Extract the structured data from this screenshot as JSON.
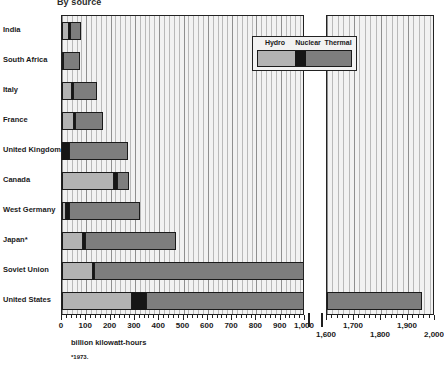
{
  "title": "By source",
  "axis_title": "billion kilowatt-hours",
  "footnote": "*1973.",
  "legend": {
    "items": [
      {
        "label": "Hydro",
        "color": "#b3b3b3"
      },
      {
        "label": "Nuclear",
        "color": "#161616"
      },
      {
        "label": "Thermal",
        "color": "#7e7e7e"
      }
    ]
  },
  "chart_data": {
    "type": "bar",
    "orientation": "horizontal",
    "stacked": true,
    "title": "By source",
    "xlabel": "billion kilowatt-hours",
    "ylabel": "",
    "grid": true,
    "legend_position": "inside-top-right",
    "broken_axis": true,
    "axis_segments": [
      {
        "name": "left",
        "range": [
          0,
          1000
        ],
        "ticks_major": [
          0,
          100,
          200,
          300,
          400,
          500,
          600,
          700,
          800,
          900,
          1000
        ],
        "tick_labels": [
          "0",
          "100",
          "200",
          "300",
          "400",
          "500",
          "600",
          "700",
          "800",
          "900",
          "1,000"
        ],
        "minor_step": 20
      },
      {
        "name": "right",
        "range": [
          1600,
          2000
        ],
        "ticks_major": [
          1600,
          1700,
          1800,
          1900,
          2000
        ],
        "tick_labels": [
          "1,600",
          "1,700",
          "1,800",
          "1,900",
          "2,000"
        ],
        "minor_step": 20
      }
    ],
    "categories": [
      "India",
      "South Africa",
      "Italy",
      "France",
      "United Kingdom",
      "Canada",
      "West Germany",
      "Japan*",
      "Soviet Union",
      "United States"
    ],
    "series": [
      {
        "name": "Hydro",
        "color": "#b3b3b3",
        "values": [
          30,
          3,
          42,
          48,
          2,
          215,
          17,
          85,
          128,
          290
        ]
      },
      {
        "name": "Nuclear",
        "color": "#161616",
        "values": [
          2,
          2,
          3,
          5,
          28,
          12,
          12,
          10,
          4,
          55
        ]
      },
      {
        "name": "Thermal",
        "color": "#7e7e7e",
        "values": [
          48,
          68,
          100,
          117,
          240,
          48,
          291,
          375,
          868,
          1605
        ]
      }
    ],
    "totals": [
      80,
      73,
      145,
      170,
      270,
      275,
      320,
      470,
      1000,
      1950
    ]
  },
  "y_labels": [
    "India",
    "South Africa",
    "Italy",
    "France",
    "United Kingdom",
    "Canada",
    "West Germany",
    "Japan*",
    "Soviet Union",
    "United States"
  ]
}
